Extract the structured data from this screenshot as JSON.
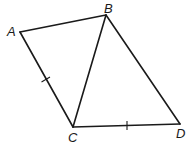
{
  "diagram": {
    "type": "geometry-figure",
    "stroke_color": "#1a1a1a",
    "background_color": "#ffffff",
    "vertices": {
      "A": {
        "label": "A",
        "x": 20,
        "y": 32,
        "label_x": 7,
        "label_y": 36
      },
      "B": {
        "label": "B",
        "x": 106,
        "y": 15,
        "label_x": 104,
        "label_y": 13
      },
      "C": {
        "label": "C",
        "x": 73,
        "y": 127,
        "label_x": 68,
        "label_y": 142
      },
      "D": {
        "label": "D",
        "x": 180,
        "y": 124,
        "label_x": 176,
        "label_y": 138
      }
    },
    "segments": [
      {
        "name": "AB",
        "from": "A",
        "to": "B"
      },
      {
        "name": "AC",
        "from": "A",
        "to": "C",
        "tick_marks": 1
      },
      {
        "name": "BC",
        "from": "B",
        "to": "C"
      },
      {
        "name": "BD",
        "from": "B",
        "to": "D"
      },
      {
        "name": "CD",
        "from": "C",
        "to": "D",
        "tick_marks": 1
      }
    ],
    "congruence": [
      "AC",
      "CD"
    ]
  }
}
